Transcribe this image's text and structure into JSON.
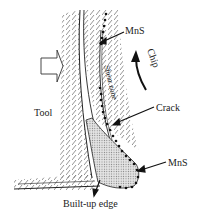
{
  "diagram": {
    "type": "machining-chip-formation-schematic",
    "labels": {
      "mns_top": "MnS",
      "chip": "Chip",
      "shear_zone": "Shear zone",
      "tool": "Tool",
      "crack": "Crack",
      "mns_bottom": "MnS",
      "built_up_edge": "Built-up edge"
    },
    "colors": {
      "line": "#222222",
      "hatch": "#555555",
      "bue_fill": "#cfcfcf",
      "dot": "#111111",
      "background": "#ffffff"
    }
  }
}
